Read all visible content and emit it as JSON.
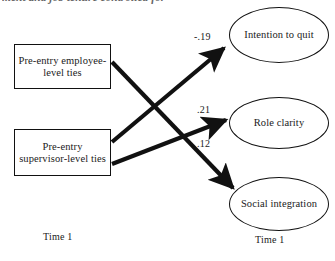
{
  "figure": {
    "caption_cropped": "ment and job tenure controlled for",
    "type": "path-diagram"
  },
  "nodes": {
    "boxes": [
      {
        "id": "employee",
        "label": "Pre-entry employee-level ties",
        "shape": "rectangle"
      },
      {
        "id": "supervisor",
        "label": "Pre-entry supervisor-level ties",
        "shape": "rectangle"
      }
    ],
    "ellipses": [
      {
        "id": "intention",
        "label": "Intention to quit",
        "shape": "ellipse"
      },
      {
        "id": "role",
        "label": "Role clarity",
        "shape": "ellipse"
      },
      {
        "id": "social",
        "label": "Social integration",
        "shape": "ellipse"
      }
    ]
  },
  "paths": [
    {
      "from": "supervisor",
      "to": "intention",
      "coefficient": "-.19"
    },
    {
      "from": "supervisor",
      "to": "role",
      "coefficient": ".21"
    },
    {
      "from": "employee",
      "to": "social",
      "coefficient": ".12"
    }
  ],
  "axis_labels": {
    "left_time": "Time 1",
    "right_time": "Time 1"
  },
  "colors": {
    "stroke": "#111111",
    "background": "#ffffff",
    "text": "#1a1a1a"
  }
}
